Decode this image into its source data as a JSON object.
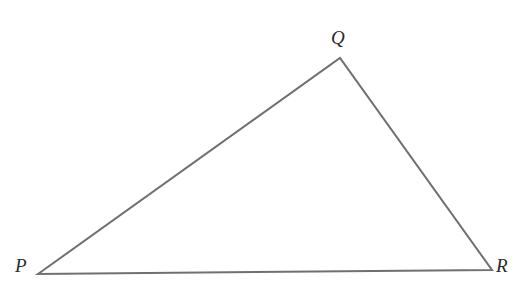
{
  "figure": {
    "name": "triangle-pqr",
    "type": "geometry-diagram",
    "shape": "triangle",
    "background_color": "#ffffff",
    "stroke_color": "#707070",
    "stroke_width": 2,
    "fill": "none",
    "label_color": "#2b2b2b",
    "label_style": "italic-serif",
    "canvas": {
      "width": 530,
      "height": 290
    },
    "vertices": [
      {
        "id": "P",
        "label": "P",
        "x": 38,
        "y": 274,
        "label_x": 15,
        "label_y": 256
      },
      {
        "id": "Q",
        "label": "Q",
        "x": 340,
        "y": 58,
        "label_x": 331,
        "label_y": 28
      },
      {
        "id": "R",
        "label": "R",
        "x": 492,
        "y": 270,
        "label_x": 496,
        "label_y": 256
      }
    ],
    "edges": [
      {
        "id": "PQ",
        "from": "P",
        "to": "Q"
      },
      {
        "id": "QR",
        "from": "Q",
        "to": "R"
      },
      {
        "id": "RP",
        "from": "R",
        "to": "P"
      }
    ],
    "path": "M 38 274 L 340 58 L 492 270 Z"
  }
}
